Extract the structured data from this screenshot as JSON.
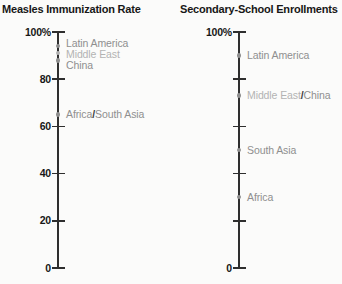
{
  "figure": {
    "background": "#fbfbfa"
  },
  "palette": {
    "mid": "#8f8f8f",
    "light": "#b3b3b3",
    "dark": "#3c3c3c",
    "axis": "#2e2e2e",
    "text": "#171717"
  },
  "chart_data": [
    {
      "type": "scatter",
      "title": "Measles Immunization Rate",
      "xlabel": "",
      "ylabel": "",
      "ylim": [
        0,
        100
      ],
      "unit": "%",
      "grid": false,
      "legend": "none",
      "ticks": [
        {
          "value": 100,
          "label": "100%"
        },
        {
          "value": 80,
          "label": "80"
        },
        {
          "value": 60,
          "label": "60"
        },
        {
          "value": 40,
          "label": "40"
        },
        {
          "value": 20,
          "label": "20"
        },
        {
          "value": 0,
          "label": "0"
        }
      ],
      "points": [
        {
          "name": "Latin America",
          "value": 94,
          "label_at": 95.3,
          "dot_tone": "mid",
          "segments": [
            {
              "text": "Latin America",
              "tone": "mid"
            }
          ]
        },
        {
          "name": "Middle East",
          "value": 91,
          "label_at": 90.5,
          "dot_tone": "light",
          "segments": [
            {
              "text": "Middle East",
              "tone": "light"
            }
          ]
        },
        {
          "name": "China",
          "value": 88,
          "label_at": 85.6,
          "dot_tone": "mid",
          "segments": [
            {
              "text": "China",
              "tone": "mid"
            }
          ]
        },
        {
          "name": "Africa/South Asia",
          "value": 65,
          "label_at": 65,
          "dot_tone": "mid",
          "segments": [
            {
              "text": "Africa",
              "tone": "mid"
            },
            {
              "text": "/",
              "tone": "dark"
            },
            {
              "text": "South Asia",
              "tone": "mid"
            }
          ]
        }
      ]
    },
    {
      "type": "scatter",
      "title": "Secondary-School Enrollments",
      "xlabel": "",
      "ylabel": "",
      "ylim": [
        0,
        100
      ],
      "unit": "%",
      "grid": false,
      "legend": "none",
      "ticks": [
        {
          "value": 100,
          "label": "100%"
        },
        {
          "value": 80,
          "label": ""
        },
        {
          "value": 60,
          "label": ""
        },
        {
          "value": 40,
          "label": ""
        },
        {
          "value": 20,
          "label": ""
        },
        {
          "value": 0,
          "label": "0"
        }
      ],
      "points": [
        {
          "name": "Latin America",
          "value": 90,
          "label_at": 90,
          "dot_tone": "mid",
          "segments": [
            {
              "text": "Latin America",
              "tone": "mid"
            }
          ]
        },
        {
          "name": "Middle East/China",
          "value": 73,
          "label_at": 73,
          "dot_tone": "mid",
          "segments": [
            {
              "text": "Middle East",
              "tone": "light"
            },
            {
              "text": "/",
              "tone": "dark"
            },
            {
              "text": "China",
              "tone": "mid"
            }
          ]
        },
        {
          "name": "South Asia",
          "value": 50,
          "label_at": 50,
          "dot_tone": "mid",
          "segments": [
            {
              "text": "South Asia",
              "tone": "mid"
            }
          ]
        },
        {
          "name": "Africa",
          "value": 30,
          "label_at": 30,
          "dot_tone": "mid",
          "segments": [
            {
              "text": "Africa",
              "tone": "mid"
            }
          ]
        }
      ]
    }
  ]
}
